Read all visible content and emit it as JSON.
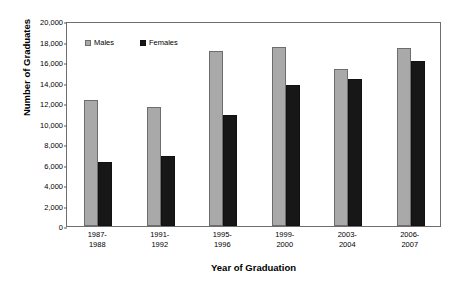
{
  "chart_data": {
    "type": "bar",
    "title": "",
    "xlabel": "Year of Graduation",
    "ylabel": "Number of Graduates",
    "categories": [
      "1987-1988",
      "1991-1992",
      "1995-1996",
      "1999-2000",
      "2003-2004",
      "2006-2007"
    ],
    "category_lines": [
      {
        "line1": "1987-",
        "line2": "1988"
      },
      {
        "line1": "1991-",
        "line2": "1992"
      },
      {
        "line1": "1995-",
        "line2": "1996"
      },
      {
        "line1": "1999-",
        "line2": "2000"
      },
      {
        "line1": "2003-",
        "line2": "2004"
      },
      {
        "line1": "2006-",
        "line2": "2007"
      }
    ],
    "series": [
      {
        "name": "Males",
        "color": "#a9a9a9",
        "values": [
          12300,
          11650,
          17100,
          17450,
          15300,
          17350
        ]
      },
      {
        "name": "Females",
        "color": "#171717",
        "values": [
          6250,
          6800,
          10800,
          13800,
          14300,
          16100
        ]
      }
    ],
    "ylim": [
      0,
      20000
    ],
    "ytick_step": 2000,
    "ytick_labels": [
      "0",
      "2,000",
      "4,000",
      "6,000",
      "8,000",
      "10,000",
      "12,000",
      "14,000",
      "16,000",
      "18,000",
      "20,000"
    ],
    "ytick_values": [
      0,
      2000,
      4000,
      6000,
      8000,
      10000,
      12000,
      14000,
      16000,
      18000,
      20000
    ],
    "grid": false,
    "legend_position": "top-left-inside",
    "frame": true,
    "colors": {
      "males": "#a9a9a9",
      "females": "#171717",
      "frame": "#6e6e6e",
      "background": "#ffffff",
      "text": "#000000"
    }
  }
}
